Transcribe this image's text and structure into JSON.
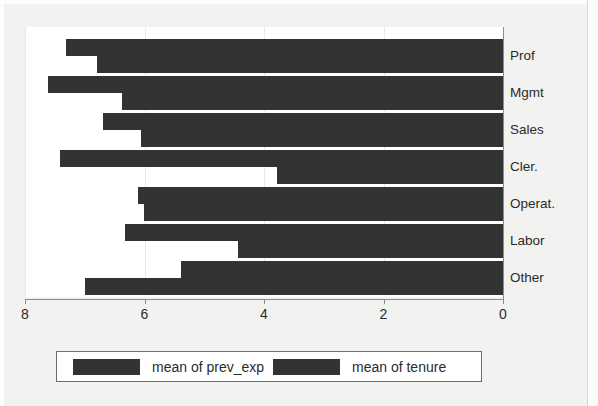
{
  "chart_data": {
    "type": "bar",
    "orientation": "horizontal",
    "title": "",
    "xlabel": "",
    "ylabel": "",
    "categories": [
      "Prof",
      "Mgmt",
      "Sales",
      "Cler.",
      "Operat.",
      "Labor",
      "Other"
    ],
    "series": [
      {
        "name": "mean of prev_exp",
        "values": [
          7.31,
          7.62,
          6.7,
          7.41,
          6.11,
          6.32,
          5.39
        ]
      },
      {
        "name": "mean of tenure",
        "values": [
          6.8,
          6.37,
          6.06,
          3.78,
          6.01,
          4.43,
          7.0
        ]
      }
    ],
    "xlim": [
      8,
      0
    ],
    "x_axis_reversed": true,
    "xticks": [
      8,
      6,
      4,
      2,
      0
    ],
    "xtick_labels": [
      "8",
      "6",
      "4",
      "2",
      "0"
    ],
    "grid": "vertical-faint",
    "legend_position": "bottom",
    "bar_color": "#333333",
    "plot_background": "#ffffff",
    "figure_background": "#f2f2f0"
  },
  "legend": {
    "items": [
      {
        "label": "mean of prev_exp",
        "swatch_color": "#333333"
      },
      {
        "label": "mean of tenure",
        "swatch_color": "#333333"
      }
    ]
  },
  "axis": {
    "x_tick_labels": [
      "8",
      "6",
      "4",
      "2",
      "0"
    ]
  },
  "categories": [
    {
      "label": "Prof"
    },
    {
      "label": "Mgmt"
    },
    {
      "label": "Sales"
    },
    {
      "label": "Cler."
    },
    {
      "label": "Operat."
    },
    {
      "label": "Labor"
    },
    {
      "label": "Other"
    }
  ]
}
